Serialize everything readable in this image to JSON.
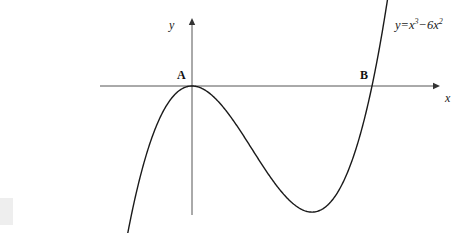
{
  "figure": {
    "background_color": "#ffffff",
    "width": 463,
    "height": 233
  },
  "axes": {
    "x_label": "x",
    "y_label": "y",
    "origin_px": {
      "x": 192,
      "y": 86
    },
    "x_scale_px_per_unit": 30,
    "y_scale_px_per_unit": 3.94,
    "x_axis": {
      "start_px": 100,
      "end_px": 440,
      "y_px": 86,
      "arrow": "right"
    },
    "y_axis": {
      "top_px": 18,
      "bottom_px": 215,
      "x_px": 192,
      "arrow": "up"
    },
    "grid": false,
    "tick_labels": [],
    "axis_color": "#555555"
  },
  "curve": {
    "equation_text": "y=x",
    "equation_exp1": "3",
    "equation_minus": "−6x",
    "equation_exp2": "2",
    "color": "#1a1a1a",
    "stroke_width": 1.4,
    "x_domain": [
      -2.15,
      6.65
    ]
  },
  "points": [
    {
      "name": "A",
      "label": "A",
      "x": 0,
      "y": 0,
      "label_px": {
        "x": 177,
        "y": 69
      }
    },
    {
      "name": "B",
      "label": "B",
      "x": 6,
      "y": 0,
      "label_px": {
        "x": 360,
        "y": 69
      }
    }
  ],
  "chart_data": {
    "type": "line",
    "title": "",
    "xlabel": "x",
    "ylabel": "y",
    "legend": [],
    "grid": false,
    "function": "y = x^3 - 6x^2",
    "annotations": [
      {
        "text": "y=x³−6x²",
        "role": "curve-equation"
      },
      {
        "text": "A",
        "role": "x-intercept-tangent",
        "x": 0,
        "y": 0
      },
      {
        "text": "B",
        "role": "x-intercept-crossing",
        "x": 6,
        "y": 0
      }
    ],
    "roots": [
      0,
      6
    ],
    "turning_points": [
      {
        "type": "local-maximum",
        "x": 0,
        "y": 0
      },
      {
        "type": "local-minimum",
        "x": 4,
        "y": -32
      }
    ],
    "xlim": [
      -2.15,
      6.65
    ],
    "ylim": [
      -37,
      22
    ],
    "series": [
      {
        "name": "y = x^3 - 6x^2",
        "x": [
          -2.15,
          -2.0,
          -1.8,
          -1.6,
          -1.4,
          -1.2,
          -1.0,
          -0.8,
          -0.6,
          -0.4,
          -0.2,
          0.0,
          0.2,
          0.4,
          0.6,
          0.8,
          1.0,
          1.4,
          1.8,
          2.2,
          2.6,
          3.0,
          3.4,
          3.8,
          4.0,
          4.2,
          4.6,
          5.0,
          5.4,
          5.8,
          6.0,
          6.2,
          6.4,
          6.65
        ],
        "y": [
          -37.7,
          -32.0,
          -25.3,
          -19.5,
          -14.5,
          -10.4,
          -7.0,
          -4.35,
          -2.38,
          -1.02,
          -0.25,
          0.0,
          -0.23,
          -0.9,
          -1.94,
          -3.33,
          -5.0,
          -9.0,
          -13.6,
          -18.4,
          -23.0,
          -27.0,
          -30.1,
          -31.8,
          -32.0,
          -31.8,
          -29.6,
          -25.0,
          -17.5,
          -6.7,
          0.0,
          7.7,
          16.4,
          27.3
        ]
      }
    ]
  }
}
